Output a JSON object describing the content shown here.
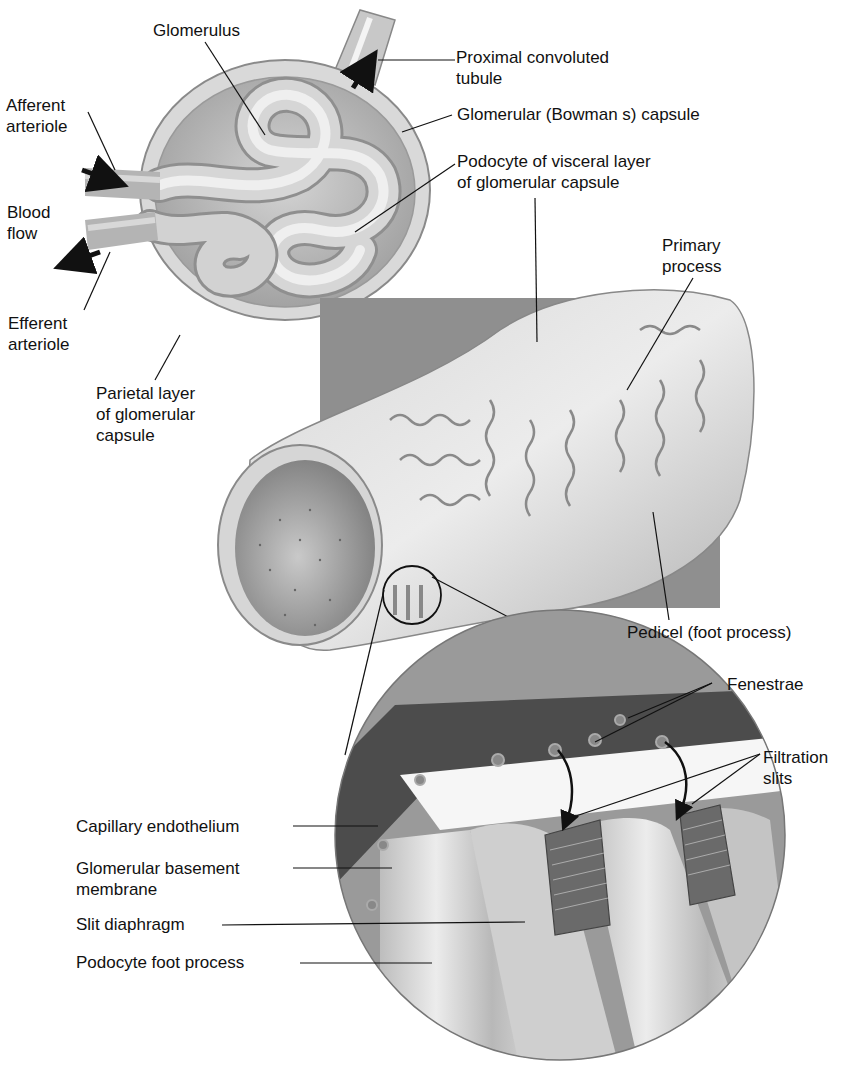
{
  "diagram": {
    "colors": {
      "background": "#ffffff",
      "tissue_light": "#e2e2e2",
      "tissue_mid": "#bdbdbd",
      "tissue_dark": "#7a7a7a",
      "backdrop_panel": "#8c8c8c",
      "endothelium_band": "#4a4a4a",
      "label_text": "#111111",
      "leader_line": "#111111"
    },
    "labels": {
      "glomerulus": "Glomerulus",
      "afferent_arteriole": "Afferent\narteriole",
      "blood_flow": "Blood\nflow",
      "efferent_arteriole": "Efferent\narteriole",
      "parietal_layer": "Parietal layer\nof glomerular\ncapsule",
      "proximal_convoluted_tubule": "Proximal convoluted\ntubule",
      "glomerular_capsule": "Glomerular (Bowman s) capsule",
      "podocyte_visceral_layer": "Podocyte of visceral layer\nof glomerular capsule",
      "primary_process": "Primary\nprocess",
      "pedicel": "Pedicel (foot process)",
      "fenestrae": "Fenestrae",
      "filtration_slits": "Filtration\nslits",
      "capillary_endothelium": "Capillary endothelium",
      "glomerular_basement_membrane": "Glomerular basement\nmembrane",
      "slit_diaphragm": "Slit diaphragm",
      "podocyte_foot_process": "Podocyte foot process"
    },
    "panels": [
      {
        "name": "renal-corpuscle",
        "description": "Glomerulus within glomerular capsule"
      },
      {
        "name": "capillary-with-podocytes",
        "description": "Capillary wrapped by podocyte processes"
      },
      {
        "name": "filtration-membrane-magnified",
        "description": "Magnified circular inset of filtration membrane"
      }
    ]
  }
}
